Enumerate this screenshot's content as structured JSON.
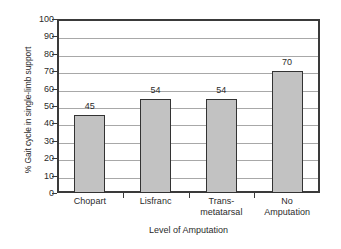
{
  "chart_data": {
    "type": "bar",
    "title": "",
    "xlabel": "Level of Amputation",
    "ylabel": "% Gait cycle in single-limb support",
    "categories": [
      "Chopart",
      "Lisfranc",
      "Trans-metatarsal",
      "No Amputation"
    ],
    "category_lines": [
      [
        "Chopart"
      ],
      [
        "Lisfranc"
      ],
      [
        "Trans-",
        "metatarsal"
      ],
      [
        "No",
        "Amputation"
      ]
    ],
    "values": [
      45,
      54,
      54,
      70
    ],
    "data_labels": [
      "45",
      "54",
      "54",
      "70"
    ],
    "ylim": [
      0,
      100
    ],
    "ytick_values": [
      0,
      10,
      20,
      30,
      40,
      50,
      60,
      70,
      80,
      90,
      100
    ],
    "ytick_labels": [
      "0",
      "10",
      "20",
      "30",
      "40",
      "50",
      "60",
      "70",
      "80",
      "90",
      "100"
    ],
    "grid": true,
    "grid_axis": "y",
    "legend": false,
    "legend_position": "none",
    "colors": {
      "bar_fill": "#c2c2c2",
      "bar_border": "#333333",
      "gridline": "#a8a8a8",
      "axis": "#3a3a3a",
      "text": "#2b2b2b",
      "background": "#ffffff"
    }
  }
}
